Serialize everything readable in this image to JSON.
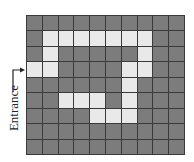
{
  "diagram": {
    "type": "maze-grid",
    "rows": 9,
    "cols": 10,
    "entrance_label": "Entrance",
    "entrance_row": 3,
    "colors": {
      "wall": "#7c7c7c",
      "path": "#e9e9e9",
      "grid_line": "#3a3a3a"
    },
    "grid": [
      "0000000000",
      "0111111100",
      "0100000100",
      "1100001100",
      "0000001000",
      "0011101000",
      "0000111000",
      "0000000000",
      "0000000000"
    ]
  }
}
